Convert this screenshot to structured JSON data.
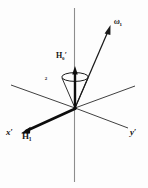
{
  "figure": {
    "background_color": "#fdfdfd",
    "line_color": "#1a1a1a",
    "axes": [
      {
        "name": "x-prime",
        "label": "x",
        "prime": "′",
        "direction": "lower-left",
        "thick": true
      },
      {
        "name": "y-prime",
        "label": "y",
        "prime": "′",
        "direction": "lower-right",
        "thick": false
      },
      {
        "name": "z-vertical",
        "label": "",
        "prime": "",
        "direction": "vertical",
        "thick": false
      }
    ],
    "labels": {
      "x_axis": "x",
      "x_axis_prime": "′",
      "y_axis": "y",
      "y_axis_prime": "′",
      "h1_vector": "H",
      "h1_subscript": "1",
      "h0_vector": "H",
      "h0_subscript": "0",
      "h0_prime": "′",
      "omega1_vector": "ω",
      "omega1_subscript": "1",
      "omega2_cone": "ω",
      "omega2_subscript": "2"
    },
    "elements": [
      {
        "name": "precession-cone",
        "description": "cone with elliptical top around vertical axis"
      },
      {
        "name": "h0-arrow",
        "description": "thick vertical arrow from origin upward"
      },
      {
        "name": "omega1-arrow",
        "description": "arrow from origin to upper right"
      },
      {
        "name": "h1-arrow",
        "description": "thick arrow from origin to lower left along x-prime"
      }
    ]
  }
}
